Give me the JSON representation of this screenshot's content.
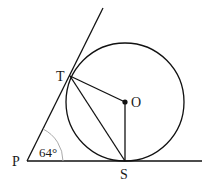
{
  "diagram": {
    "type": "geometry",
    "points": {
      "P": {
        "label": "P",
        "x": 27,
        "y": 161
      },
      "T": {
        "label": "T",
        "x": 70,
        "y": 76
      },
      "O": {
        "label": "O",
        "x": 125,
        "y": 102
      },
      "S": {
        "label": "S",
        "x": 125,
        "y": 161
      }
    },
    "circle": {
      "center": "O",
      "radius": 59
    },
    "angle": {
      "vertex": "P",
      "label": "64°"
    },
    "colors": {
      "line": "#111111",
      "arc": "#aaaaaa",
      "background": "#ffffff"
    }
  }
}
